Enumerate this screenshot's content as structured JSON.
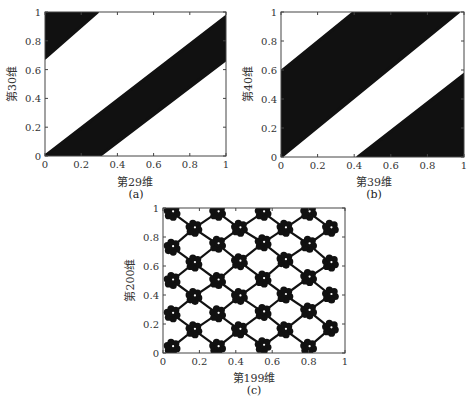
{
  "chart_data": [
    {
      "id": "a",
      "type": "scatter",
      "caption": "(a)",
      "xlabel": "第29维",
      "ylabel": "第30维",
      "xlim": [
        0,
        1
      ],
      "ylim": [
        0,
        1
      ],
      "xticks": [
        "0",
        "0.2",
        "0.4",
        "0.6",
        "0.8",
        "1"
      ],
      "yticks": [
        "0",
        "0.2",
        "0.4",
        "0.6",
        "0.8",
        "1"
      ],
      "grid": false,
      "description": "Dense black points forming a diagonal band from (0,0)-(0.3,0) up to (1,0.67)-(1,0.97), plus a triangular region in the top-left corner bounded by (0,0.68),(0,1),(0.3,1).",
      "regions": [
        {
          "shape": "polygon",
          "points": [
            [
              0,
              0
            ],
            [
              0.3,
              0
            ],
            [
              1,
              0.67
            ],
            [
              1,
              0.97
            ]
          ]
        },
        {
          "shape": "polygon",
          "points": [
            [
              0,
              0.68
            ],
            [
              0,
              1
            ],
            [
              0.29,
              1
            ]
          ]
        }
      ],
      "marker_color": "#111111"
    },
    {
      "id": "b",
      "type": "scatter",
      "caption": "(b)",
      "xlabel": "第39维",
      "ylabel": "第40维",
      "xlim": [
        0,
        1
      ],
      "ylim": [
        0,
        1
      ],
      "xticks": [
        "0",
        "0.2",
        "0.4",
        "0.6",
        "0.8",
        "1"
      ],
      "yticks": [
        "0",
        "0.2",
        "0.4",
        "0.6",
        "0.8",
        "1"
      ],
      "grid": false,
      "description": "Dense grid of black points forming a wide diagonal band from (0,0)-(0,0.59) to (0.4,1)-(1,1), and a lower-right triangle bounded by (0.42,0),(1,0),(1,0.57).",
      "regions": [
        {
          "shape": "polygon",
          "points": [
            [
              0,
              0
            ],
            [
              0,
              0.59
            ],
            [
              0.4,
              1
            ],
            [
              0.97,
              1
            ]
          ]
        },
        {
          "shape": "polygon",
          "points": [
            [
              0.42,
              0
            ],
            [
              1,
              0
            ],
            [
              1,
              0.57
            ]
          ]
        }
      ],
      "marker_color": "#111111"
    },
    {
      "id": "c",
      "type": "scatter",
      "caption": "(c)",
      "xlabel": "第199维",
      "ylabel": "第200维",
      "xlim": [
        0,
        1
      ],
      "ylim": [
        0,
        1
      ],
      "xticks": [
        "0",
        "0.2",
        "0.4",
        "0.6",
        "0.8",
        "1"
      ],
      "yticks": [
        "0",
        "0.2",
        "0.4",
        "0.6",
        "0.8",
        "1"
      ],
      "grid": false,
      "description": "Black points forming a lattice of flower-like clusters arranged in a staggered (hexagonal) pattern, connected by thin diagonal chains.",
      "cluster_centers": [
        [
          0.05,
          0.97
        ],
        [
          0.3,
          0.97
        ],
        [
          0.55,
          0.97
        ],
        [
          0.8,
          0.97
        ],
        [
          0.17,
          0.86
        ],
        [
          0.42,
          0.86
        ],
        [
          0.67,
          0.86
        ],
        [
          0.92,
          0.86
        ],
        [
          0.05,
          0.73
        ],
        [
          0.3,
          0.75
        ],
        [
          0.55,
          0.76
        ],
        [
          0.8,
          0.75
        ],
        [
          0.17,
          0.62
        ],
        [
          0.42,
          0.63
        ],
        [
          0.67,
          0.64
        ],
        [
          0.92,
          0.62
        ],
        [
          0.05,
          0.5
        ],
        [
          0.3,
          0.5
        ],
        [
          0.55,
          0.51
        ],
        [
          0.8,
          0.52
        ],
        [
          0.17,
          0.39
        ],
        [
          0.42,
          0.39
        ],
        [
          0.67,
          0.4
        ],
        [
          0.92,
          0.4
        ],
        [
          0.05,
          0.27
        ],
        [
          0.3,
          0.27
        ],
        [
          0.55,
          0.28
        ],
        [
          0.8,
          0.29
        ],
        [
          0.17,
          0.16
        ],
        [
          0.42,
          0.16
        ],
        [
          0.67,
          0.16
        ],
        [
          0.92,
          0.17
        ],
        [
          0.05,
          0.04
        ],
        [
          0.3,
          0.04
        ],
        [
          0.55,
          0.05
        ],
        [
          0.8,
          0.04
        ]
      ],
      "marker_color": "#111111"
    }
  ]
}
